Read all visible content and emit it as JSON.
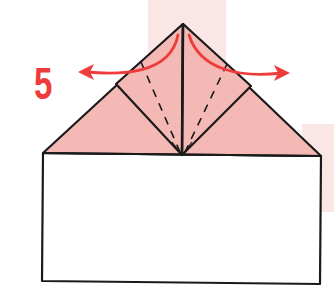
{
  "diagram": {
    "type": "origami-step",
    "step_number": "5",
    "colors": {
      "paper_colored": "#f4b9b5",
      "paper_white": "#ffffff",
      "outline": "#1a1a1a",
      "arrow": "#ee3b3b",
      "step_number": "#ee3b3b",
      "background_band": "#fbe6e6"
    },
    "elements": [
      "large triangle (colored side) on top of white rectangle",
      "two square flaps folded up meeting at center line",
      "dashed valley fold lines on each flap",
      "two curved red arrows pointing outward (unfold flaps)"
    ]
  }
}
